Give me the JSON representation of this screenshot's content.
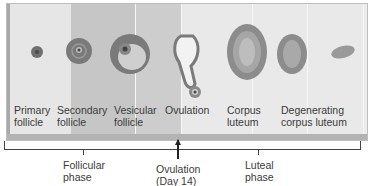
{
  "stages": [
    {
      "label": "Primary\nfollicle"
    },
    {
      "label": "Secondary\nfollicle"
    },
    {
      "label": "Vesicular\nfollicle"
    },
    {
      "label": "Ovulation"
    },
    {
      "label": "Corpus\nluteum"
    },
    {
      "label": "Degenerating\ncorpus luteum"
    }
  ],
  "phases": [
    {
      "label": "Follicular\nphase"
    },
    {
      "label": "Ovulation\n(Day 14)"
    },
    {
      "label": "Luteal\nphase"
    }
  ],
  "colors": {
    "follicle_dark": "#6f6f6f",
    "follicle_mid": "#9a9a9a",
    "luteum": "#8c8c8c",
    "background_light": "#e6e6e6",
    "background_dark": "#c6c6c6"
  }
}
